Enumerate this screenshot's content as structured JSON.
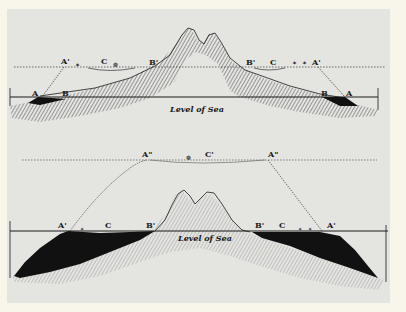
{
  "colors": {
    "page": "#f8f5ea",
    "plate": "#e4e4e1",
    "ink": "#1a1a1a",
    "hatch": "#555555"
  },
  "figure_top": {
    "sea_label": "Level of Sea",
    "labels": {
      "left_A_prime": "A'",
      "left_C": "C",
      "left_B_prime": "B'",
      "left_A": "A",
      "left_B": "B",
      "right_B_prime": "B'",
      "right_C": "C",
      "right_A_prime": "A'",
      "right_B": "B",
      "right_A": "A"
    }
  },
  "figure_bottom": {
    "sea_label": "Level of Sea",
    "labels": {
      "top_A_dprime_left": "A\"",
      "top_C_prime": "C'",
      "top_A_dprime_right": "A\"",
      "left_A_prime": "A'",
      "left_C": "C",
      "left_B_prime": "B'",
      "right_B_prime": "B'",
      "right_C": "C",
      "right_A_prime": "A'"
    }
  }
}
